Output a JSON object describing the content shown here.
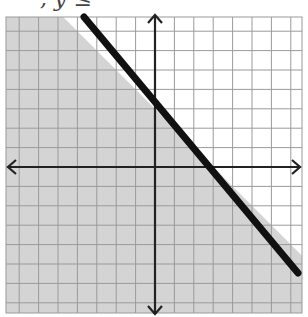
{
  "caption": ", y ≤",
  "graph": {
    "inequality": "y ≤ -x + 3",
    "boundary": {
      "slope": -1,
      "intercept": 3,
      "style": "solid"
    },
    "shaded_region": "below",
    "x_range": [
      -8,
      8
    ],
    "y_range": [
      -8,
      8
    ],
    "grid_step": 1,
    "colors": {
      "shade": "#d4d4d4",
      "grid": "#9a9a9a",
      "grid_light": "#ffffff",
      "axis": "#222222",
      "boundary_line": "#111111",
      "background": "#ffffff"
    }
  },
  "layout": {
    "origin_px": [
      155,
      167
    ],
    "cell_px": 19.4,
    "grid_left": 6,
    "grid_top": 17,
    "grid_right": 302,
    "grid_bottom": 313
  }
}
